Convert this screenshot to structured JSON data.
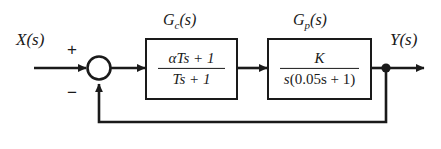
{
  "diagram": {
    "input_label": "X(s)",
    "output_label": "Y(s)",
    "summing_junction": {
      "name": "summing-junction",
      "plus_sign": "+",
      "minus_sign": "−"
    },
    "blocks": [
      {
        "id": "controller",
        "label": "G",
        "label_sub": "c",
        "label_tail": "(s)",
        "numerator_alpha": "α",
        "numerator": "Ts + 1",
        "denominator": "Ts + 1"
      },
      {
        "id": "plant",
        "label": "G",
        "label_sub": "p",
        "label_tail": "(s)",
        "numerator": "K",
        "denominator_lead": "s",
        "denominator_paren": "(0.05s + 1)"
      }
    ],
    "feedback": {
      "type": "unity",
      "path_label": ""
    },
    "colors": {
      "line": "#1a1a1a",
      "background": "#ffffff",
      "text": "#1a1a1a"
    }
  }
}
